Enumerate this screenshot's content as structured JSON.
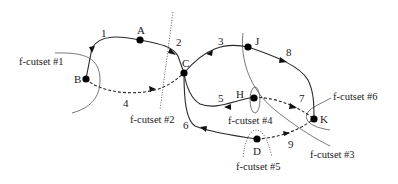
{
  "diagram": {
    "nodes": [
      {
        "id": "A",
        "label": "A"
      },
      {
        "id": "B",
        "label": "B"
      },
      {
        "id": "C",
        "label": "C"
      },
      {
        "id": "D",
        "label": "D"
      },
      {
        "id": "H",
        "label": "H"
      },
      {
        "id": "J",
        "label": "J"
      },
      {
        "id": "K",
        "label": "K"
      }
    ],
    "edges": [
      {
        "id": "1",
        "label": "1",
        "from": "A",
        "to": "B",
        "style": "solid"
      },
      {
        "id": "2",
        "label": "2",
        "from": "A",
        "to": "C",
        "style": "solid"
      },
      {
        "id": "3",
        "label": "3",
        "from": "J",
        "to": "C",
        "style": "solid"
      },
      {
        "id": "4",
        "label": "4",
        "from": "B",
        "to": "C",
        "style": "dashed"
      },
      {
        "id": "5",
        "label": "5",
        "from": "H",
        "to": "C",
        "style": "solid"
      },
      {
        "id": "6",
        "label": "6",
        "from": "D",
        "to": "C",
        "style": "solid"
      },
      {
        "id": "7",
        "label": "7",
        "from": "H",
        "to": "K",
        "style": "dashed"
      },
      {
        "id": "8",
        "label": "8",
        "from": "J",
        "to": "K",
        "style": "solid"
      },
      {
        "id": "9",
        "label": "9",
        "from": "D",
        "to": "K",
        "style": "dashed"
      }
    ],
    "cutsets": [
      {
        "id": "1",
        "label": "f-cutset #1"
      },
      {
        "id": "2",
        "label": "f-cutset #2"
      },
      {
        "id": "3",
        "label": "f-cutset #3"
      },
      {
        "id": "4",
        "label": "f-cutset #4"
      },
      {
        "id": "5",
        "label": "f-cutset #5"
      },
      {
        "id": "6",
        "label": "f-cutset #6"
      }
    ]
  }
}
